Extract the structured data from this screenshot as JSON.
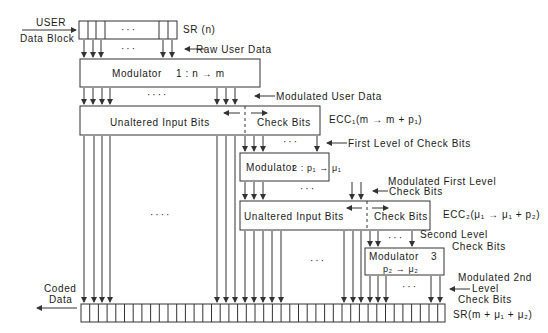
{
  "input": {
    "user_label": "USER",
    "data_block_label": "Data Block",
    "register_label": "SR (n)",
    "raw_data_label": "Raw User Data"
  },
  "modulator1": {
    "label": "Modulator",
    "ratio": "1 :  n → m"
  },
  "modulated_user_data_label": "Modulated User Data",
  "ecc1": {
    "unaltered_label": "Unaltered Input Bits",
    "check_label": "Check Bits",
    "name": "ECC₁(m → m + p₁)"
  },
  "first_level_check_bits_label": "First Level of Check Bits",
  "modulator2": {
    "label": "Modulator",
    "ratio": "2 :  p₁ → μ₁"
  },
  "modulated_first_level": {
    "line1": "Modulated First Level",
    "line2": "Check Bits"
  },
  "ecc2": {
    "unaltered_label": "Unaltered Input Bits",
    "check_label": "Check Bits",
    "name": "ECC₂(μ₁ → μ₁ + p₂)"
  },
  "second_level": {
    "line1": "Second Level",
    "line2": "Check Bits"
  },
  "modulator3": {
    "label": "Modulator",
    "number": "3",
    "ratio": "p₂ → μ₂"
  },
  "modulated_second_level": {
    "line1": "Modulated 2nd",
    "line2": "Level",
    "line3": "Check Bits"
  },
  "output": {
    "coded_label_1": "Coded",
    "coded_label_2": "Data",
    "register_label": "SR(m + μ₁ + μ₂)"
  },
  "ellipsis": "···",
  "ellipsis4": "····",
  "colors": {
    "line": "#333333",
    "background": "#ffffff"
  }
}
